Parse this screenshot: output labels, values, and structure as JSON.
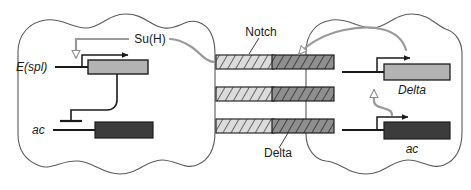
{
  "figure": {
    "width": 471,
    "height": 190,
    "background": "#ffffff"
  },
  "colors": {
    "outline": "#4d4d4d",
    "gray_signal": "#9a9a9a",
    "black_line": "#1a1a1a",
    "light_box_fill": "#b3b3b3",
    "dark_box_fill": "#3c3c3c",
    "notch_fill": "#d9d9d9",
    "delta_fill": "#8c8c8c",
    "hatch": "#3a3a3a",
    "text": "#1a1a1a"
  },
  "left_cell": {
    "name": "signal-receiving-cell",
    "labels": {
      "su_h": "Su(H)",
      "espl": "E(spl)",
      "ac": "ac"
    },
    "genes": [
      {
        "id": "espl-gene",
        "label": "E(spl)",
        "style": "italic",
        "box_shade": "light"
      },
      {
        "id": "ac-gene",
        "label": "ac",
        "style": "italic",
        "box_shade": "dark"
      }
    ],
    "interactions": [
      {
        "from": "Su(H)",
        "to": "E(spl)",
        "type": "activation",
        "color": "gray"
      },
      {
        "from": "E(spl)",
        "to": "ac",
        "type": "repression",
        "color": "black"
      }
    ]
  },
  "membrane": {
    "name": "notch-delta-receptor-ligand-pairs",
    "labels": {
      "notch": "Notch",
      "delta": "Delta"
    },
    "pair_count": 3,
    "left_protein": "Notch",
    "right_protein": "Delta"
  },
  "right_cell": {
    "name": "signal-sending-cell",
    "labels": {
      "delta": "Delta",
      "ac": "ac"
    },
    "genes": [
      {
        "id": "delta-gene",
        "label": "Delta",
        "style": "italic",
        "box_shade": "light"
      },
      {
        "id": "ac-gene-right",
        "label": "ac",
        "style": "italic",
        "box_shade": "dark"
      }
    ],
    "interactions": [
      {
        "from": "ac",
        "to": "Delta",
        "type": "activation",
        "color": "gray"
      },
      {
        "from": "Delta",
        "to": "Delta-protein",
        "type": "production",
        "color": "gray"
      }
    ]
  }
}
